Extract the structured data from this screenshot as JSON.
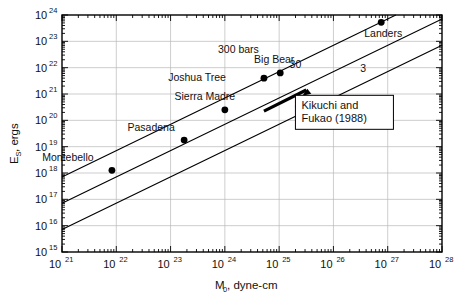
{
  "chart_data": {
    "type": "scatter",
    "title": "",
    "subtitle": "",
    "xlabel": "M0, dyne-cm",
    "xlabel_base": "M",
    "xlabel_sub": "0",
    "xlabel_rest": ", dyne-cm",
    "ylabel": "ES, ergs",
    "ylabel_base": "E",
    "ylabel_sub": "S",
    "ylabel_rest": ", ergs",
    "xscale": "log",
    "yscale": "log",
    "xlim": [
      1e+21,
      1e+28
    ],
    "ylim": [
      1000000000000000.0,
      1e+24
    ],
    "grid": true,
    "legend": "none",
    "x_tick_labels": [
      "10^21",
      "10^22",
      "10^23",
      "10^24",
      "10^25",
      "10^26",
      "10^27",
      "10^28"
    ],
    "x_tick_mantissa": [
      "10",
      "10",
      "10",
      "10",
      "10",
      "10",
      "10",
      "10"
    ],
    "x_tick_exponents": [
      "21",
      "22",
      "23",
      "24",
      "25",
      "26",
      "27",
      "28"
    ],
    "x_tick_values": [
      21,
      22,
      23,
      24,
      25,
      26,
      27,
      28
    ],
    "y_tick_labels": [
      "10^15",
      "10^16",
      "10^17",
      "10^18",
      "10^19",
      "10^20",
      "10^21",
      "10^22",
      "10^23",
      "10^24"
    ],
    "y_tick_mantissa": [
      "10",
      "10",
      "10",
      "10",
      "10",
      "10",
      "10",
      "10",
      "10",
      "10"
    ],
    "y_tick_exponents": [
      "15",
      "16",
      "17",
      "18",
      "19",
      "20",
      "21",
      "22",
      "23",
      "24"
    ],
    "y_tick_values": [
      15,
      16,
      17,
      18,
      19,
      20,
      21,
      22,
      23,
      24
    ],
    "points": [
      {
        "name": "Montebello",
        "label": "Montebello",
        "logx": 21.92,
        "logy": 18.1,
        "label_dx": -44,
        "label_dy": -9,
        "label_anchor": "middle"
      },
      {
        "name": "Pasadena",
        "label": "Pasadena",
        "logx": 23.25,
        "logy": 19.25,
        "label_dx": -33,
        "label_dy": -9,
        "label_anchor": "middle"
      },
      {
        "name": "Sierra Madre",
        "label": "Sierra Madre",
        "logx": 24.0,
        "logy": 20.4,
        "label_dx": -20,
        "label_dy": -10,
        "label_anchor": "middle"
      },
      {
        "name": "Joshua Tree",
        "label": "Joshua Tree",
        "logx": 24.72,
        "logy": 21.6,
        "label_dx": -38,
        "label_dy": 3,
        "label_anchor": "end"
      },
      {
        "name": "Big Bear",
        "label": "Big Bear",
        "logx": 25.02,
        "logy": 21.8,
        "label_dx": -6,
        "label_dy": -10,
        "label_anchor": "middle"
      },
      {
        "name": "Landers",
        "label": "Landers",
        "logx": 26.88,
        "logy": 23.72,
        "label_dx": 2,
        "label_dy": 15,
        "label_anchor": "middle"
      }
    ],
    "stress_drop_lines": [
      {
        "label": "300 bars",
        "intercept_logy_at_logx21": 17.85,
        "slope": 1.0,
        "label_logx": 24.25,
        "label_logy": 22.55
      },
      {
        "label": "30",
        "intercept_logy_at_logx21": 16.85,
        "slope": 1.0,
        "label_logx": 25.3,
        "label_logy": 22.0
      },
      {
        "label": "3",
        "intercept_logy_at_logx21": 15.85,
        "slope": 1.0,
        "label_logx": 26.55,
        "label_logy": 21.85
      }
    ],
    "annotations": [
      {
        "name": "kikuchi-fukao",
        "line1": "Kikuchi  and",
        "line2": "Fukao (1988)",
        "box_logx_left": 25.3,
        "box_logy_top": 20.95,
        "segment": {
          "x1_logx": 24.72,
          "y1_logy": 20.35,
          "x2_logx": 25.5,
          "y2_logy": 21.15
        },
        "arrow_to": {
          "logx": 25.5,
          "logy": 21.05
        }
      }
    ],
    "colors": {
      "background": "#ffffff",
      "axis": "#000000",
      "grid": "#b8b8b8",
      "marker": "#000000",
      "line": "#000000",
      "text": "#111111"
    }
  }
}
